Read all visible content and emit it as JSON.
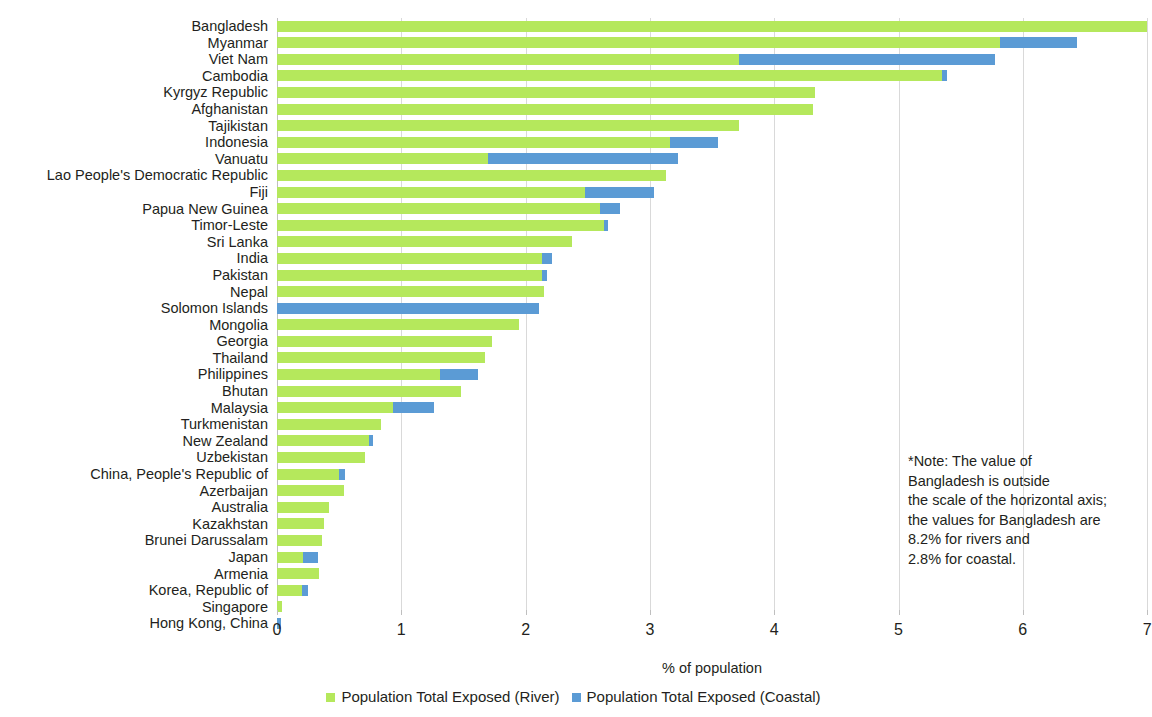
{
  "chart_data": {
    "type": "bar",
    "orientation": "horizontal",
    "stacked": true,
    "title": "",
    "xlabel": "% of population",
    "ylabel": "",
    "xlim": [
      0,
      7
    ],
    "xticks": [
      0,
      1,
      2,
      3,
      4,
      5,
      6,
      7
    ],
    "xtick_labels": [
      "0",
      "1",
      "2",
      "3",
      "4",
      "5",
      "6",
      "7"
    ],
    "grid": "vertical",
    "legend_position": "bottom-center",
    "colors": {
      "river": "#b5e85c",
      "coastal": "#5b9bd5",
      "gridline": "#d9d9d9",
      "text": "#231f20",
      "background": "#ffffff"
    },
    "categories": [
      "Bangladesh",
      "Myanmar",
      "Viet Nam",
      "Cambodia",
      "Kyrgyz Republic",
      "Afghanistan",
      "Tajikistan",
      "Indonesia",
      "Vanuatu",
      "Lao People's Democratic Republic",
      "Fiji",
      "Papua New Guinea",
      "Timor-Leste",
      "Sri Lanka",
      "India",
      "Pakistan",
      "Nepal",
      "Solomon Islands",
      "Mongolia",
      "Georgia",
      "Thailand",
      "Philippines",
      "Bhutan",
      "Malaysia",
      "Turkmenistan",
      "New Zealand",
      "Uzbekistan",
      "China, People's Republic of",
      "Azerbaijan",
      "Australia",
      "Kazakhstan",
      "Brunei Darussalam",
      "Japan",
      "Armenia",
      "Korea, Republic of",
      "Singapore",
      "Hong Kong, China"
    ],
    "series": [
      {
        "name": "Population Total Exposed (River)",
        "color": "#b5e85c",
        "values": [
          8.2,
          5.82,
          3.72,
          5.35,
          4.33,
          4.31,
          3.72,
          3.16,
          1.7,
          3.13,
          2.48,
          2.6,
          2.63,
          2.37,
          2.13,
          2.13,
          2.15,
          0.0,
          1.95,
          1.73,
          1.67,
          1.31,
          1.48,
          0.93,
          0.84,
          0.74,
          0.71,
          0.5,
          0.54,
          0.42,
          0.38,
          0.36,
          0.21,
          0.34,
          0.2,
          0.04,
          0.0
        ]
      },
      {
        "name": "Population Total Exposed (Coastal)",
        "color": "#5b9bd5",
        "values": [
          2.8,
          0.62,
          2.06,
          0.04,
          0.0,
          0.0,
          0.0,
          0.39,
          1.53,
          0.0,
          0.55,
          0.16,
          0.03,
          0.0,
          0.08,
          0.04,
          0.0,
          2.11,
          0.0,
          0.0,
          0.0,
          0.31,
          0.0,
          0.33,
          0.0,
          0.03,
          0.0,
          0.05,
          0.0,
          0.0,
          0.0,
          0.0,
          0.12,
          0.0,
          0.05,
          0.0,
          0.03
        ]
      }
    ],
    "note": {
      "lines": [
        "*Note: The value of",
        "Bangladesh is outside",
        "the scale of the horizontal axis;",
        "the values for Bangladesh are",
        "8.2% for rivers and",
        "2.8% for coastal."
      ]
    }
  }
}
